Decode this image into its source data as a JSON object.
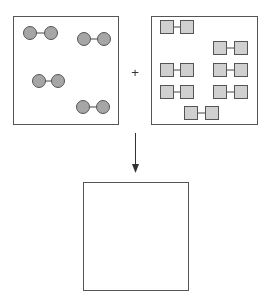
{
  "diagram": {
    "operator": "+",
    "colors": {
      "stroke": "#555555",
      "circle_fill": "#a6a6a6",
      "square_fill": "#d0d0d0"
    },
    "left_box": {
      "label": "diatomic-molecules-circles",
      "molecules": [
        {
          "a": [
            30,
            33
          ],
          "b": [
            51,
            33
          ]
        },
        {
          "a": [
            84,
            39
          ],
          "b": [
            104,
            39
          ]
        },
        {
          "a": [
            39,
            81
          ],
          "b": [
            58,
            81
          ]
        },
        {
          "a": [
            83,
            107
          ],
          "b": [
            103,
            107
          ]
        }
      ]
    },
    "right_box": {
      "label": "diatomic-molecules-squares",
      "molecules": [
        {
          "a": [
            167,
            27
          ],
          "b": [
            187,
            27
          ]
        },
        {
          "a": [
            220,
            48
          ],
          "b": [
            241,
            48
          ]
        },
        {
          "a": [
            167,
            70
          ],
          "b": [
            187,
            70
          ]
        },
        {
          "a": [
            220,
            70
          ],
          "b": [
            241,
            70
          ]
        },
        {
          "a": [
            167,
            92
          ],
          "b": [
            187,
            92
          ]
        },
        {
          "a": [
            220,
            92
          ],
          "b": [
            241,
            92
          ]
        },
        {
          "a": [
            191,
            113
          ],
          "b": [
            212,
            113
          ]
        }
      ]
    },
    "result_box": {
      "label": "empty-product-box"
    }
  }
}
